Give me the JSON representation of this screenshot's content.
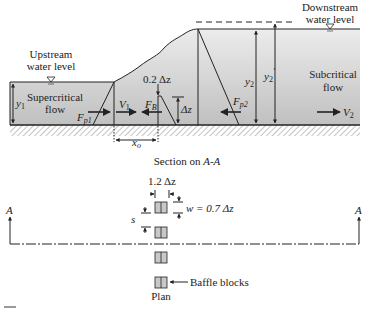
{
  "diagram": {
    "type": "hydraulic-jump-baffle-blocks",
    "section": {
      "upstream_label_line1": "Upstream",
      "upstream_label_line2": "water level",
      "downstream_label_line1": "Downstream",
      "downstream_label_line2": "water level",
      "supercritical_line1": "Supercritical",
      "supercritical_line2": "flow",
      "subcritical_line1": "Subcritical",
      "subcritical_line2": "flow",
      "y1": "y",
      "y1_sub": "1",
      "y2": "y",
      "y2_sub": "2",
      "y2p": "y",
      "y2p_sub": "2",
      "y2p_prime": "′",
      "V1": "V",
      "V1_sub": "1",
      "V2": "V",
      "V2_sub": "2",
      "Fp1": "F",
      "Fp1_sub": "p1",
      "Fp2": "F",
      "Fp2_sub": "p2",
      "FB": "F",
      "FB_sub": "B",
      "block_top": "0.2 Δz",
      "delta_z": "Δz",
      "x_o": "x",
      "x_o_sub": "o",
      "caption": "Section on ",
      "caption_italic": "A-A"
    },
    "plan": {
      "spacing_label": "1.2 Δz",
      "w_label": "w = 0.7 Δz",
      "s_label": "s",
      "section_marker_left": "A",
      "section_marker_right": "A",
      "baffle_label": "Baffle blocks",
      "caption": "Plan",
      "block_count": 4
    },
    "colors": {
      "water_top": "#e6e6e6",
      "water_bottom": "#bdbdbd",
      "line": "#222222",
      "block_fill": "#c8c8c8"
    }
  }
}
